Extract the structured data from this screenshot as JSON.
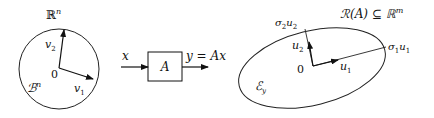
{
  "domain_space": {
    "label_main": "ℝ",
    "label_sup": "n",
    "ball_main": "ℬ",
    "ball_sup": "n",
    "origin": "0",
    "v1_main": "v",
    "v1_sub": "1",
    "v2_main": "v",
    "v2_sub": "2"
  },
  "block": {
    "input_label": "x",
    "system_label": "A",
    "output_label": "y = Ax"
  },
  "range_space": {
    "label_main": "ℛ(A) ⊆ ℝ",
    "label_sup": "m",
    "ellipse_main": "ℰ",
    "ellipse_sub": "y",
    "origin": "0",
    "u1_main": "u",
    "u1_sub": "1",
    "u2_main": "u",
    "u2_sub": "2",
    "s1u1_sigma": "σ",
    "s1u1_sigma_sub": "1",
    "s1u1_u": "u",
    "s1u1_u_sub": "1",
    "s2u2_sigma": "σ",
    "s2u2_sigma_sub": "2",
    "s2u2_u": "u",
    "s2u2_u_sub": "2"
  },
  "colors": {
    "ink": "#111111",
    "background": "#ffffff"
  }
}
